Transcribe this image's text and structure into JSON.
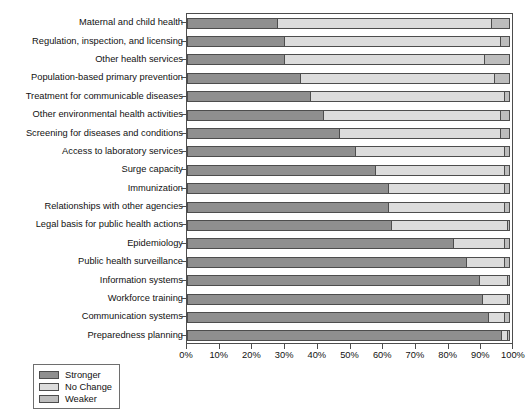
{
  "chart_data": {
    "type": "bar",
    "orientation": "horizontal",
    "stacked": true,
    "stack_mode": "percent",
    "title": "",
    "xlabel": "",
    "ylabel": "",
    "xlim": [
      0,
      100
    ],
    "grid": false,
    "legend_position": "bottom-left",
    "xticks": [
      "0%",
      "10%",
      "20%",
      "30%",
      "40%",
      "50%",
      "60%",
      "70%",
      "80%",
      "90%",
      "100%"
    ],
    "xtick_values": [
      0,
      10,
      20,
      30,
      40,
      50,
      60,
      70,
      80,
      90,
      100
    ],
    "categories": [
      "Maternal and child health",
      "Regulation, inspection, and licensing",
      "Other health services",
      "Population-based primary prevention",
      "Treatment for communicable diseases",
      "Other environmental health activities",
      "Screening for diseases and conditions",
      "Access to laboratory services",
      "Surge capacity",
      "Immunization",
      "Relationships with other agencies",
      "Legal basis for public health actions",
      "Epidemiology",
      "Public health surveillance",
      "Information systems",
      "Workforce training",
      "Communication systems",
      "Preparedness planning"
    ],
    "series": [
      {
        "name": "Stronger",
        "color": "#8f8f8f",
        "values": [
          28,
          30,
          30,
          35,
          38,
          42,
          47,
          52,
          58,
          62,
          62,
          63,
          82,
          86,
          90,
          91,
          93,
          97
        ]
      },
      {
        "name": "No Change",
        "color": "#dcdcdc",
        "values": [
          66,
          67,
          62,
          60,
          60,
          55,
          50,
          46,
          40,
          36,
          36,
          36,
          16,
          12,
          9,
          8,
          5,
          2
        ]
      },
      {
        "name": "Weaker",
        "color": "#bdbdbd",
        "values": [
          6,
          3,
          8,
          5,
          2,
          3,
          3,
          2,
          2,
          2,
          2,
          1,
          2,
          2,
          1,
          1,
          2,
          1
        ]
      }
    ]
  },
  "legend": {
    "items": [
      {
        "label": "Stronger",
        "swatch": "#8f8f8f"
      },
      {
        "label": "No Change",
        "swatch": "#dcdcdc"
      },
      {
        "label": "Weaker",
        "swatch": "#bdbdbd"
      }
    ]
  }
}
